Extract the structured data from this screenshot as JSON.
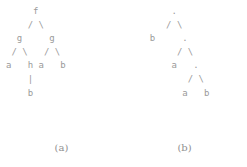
{
  "figure": {
    "background_color": "#ffffff",
    "ink_color": "#9a9a9a",
    "panels": [
      {
        "id": "a",
        "caption": "(a)",
        "tree_type": "term-tree",
        "ascii_art": "     f\n    / \\\n  g     g\n / \\   / \\\na   h a   b\n    |\n    b",
        "root": "f",
        "nodes": [
          "f",
          "g",
          "g",
          "a",
          "h",
          "a",
          "b",
          "b"
        ],
        "edges": [
          {
            "from": "f",
            "to": "g-left",
            "glyph": "/"
          },
          {
            "from": "f",
            "to": "g-right",
            "glyph": "\\"
          },
          {
            "from": "g-left",
            "to": "a-1",
            "glyph": "/"
          },
          {
            "from": "g-left",
            "to": "h",
            "glyph": "\\"
          },
          {
            "from": "g-right",
            "to": "a-2",
            "glyph": "/"
          },
          {
            "from": "g-right",
            "to": "b-2",
            "glyph": "\\"
          },
          {
            "from": "h",
            "to": "b-1",
            "glyph": "|"
          }
        ],
        "levels": [
          {
            "index": 0,
            "labels": [
              "f"
            ]
          },
          {
            "index": 1,
            "labels": [
              "g",
              "g"
            ]
          },
          {
            "index": 2,
            "labels": [
              "a",
              "h",
              "a",
              "b"
            ]
          },
          {
            "index": 3,
            "labels": [
              "b"
            ]
          }
        ]
      },
      {
        "id": "b",
        "caption": "(b)",
        "tree_type": "binary-application-tree",
        "ascii_art": "      .\n     / \\\n  b     .\n       / \\\n      a   .\n         / \\\n        a   b",
        "root": ".",
        "nodes": [
          ".",
          "b",
          ".",
          "a",
          ".",
          "a",
          "b"
        ],
        "edges": [
          {
            "from": "dot-1",
            "to": "b-1",
            "glyph": "/"
          },
          {
            "from": "dot-1",
            "to": "dot-2",
            "glyph": "\\"
          },
          {
            "from": "dot-2",
            "to": "a-1",
            "glyph": "/"
          },
          {
            "from": "dot-2",
            "to": "dot-3",
            "glyph": "\\"
          },
          {
            "from": "dot-3",
            "to": "a-2",
            "glyph": "/"
          },
          {
            "from": "dot-3",
            "to": "b-2",
            "glyph": "\\"
          }
        ],
        "levels": [
          {
            "index": 0,
            "labels": [
              "."
            ]
          },
          {
            "index": 1,
            "labels": [
              "b",
              "."
            ]
          },
          {
            "index": 2,
            "labels": [
              "a",
              "."
            ]
          },
          {
            "index": 3,
            "labels": [
              "a",
              "b"
            ]
          }
        ]
      }
    ]
  }
}
